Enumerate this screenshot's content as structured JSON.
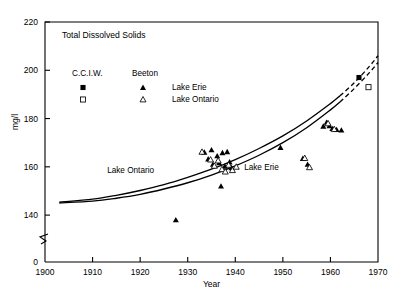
{
  "chart_data": {
    "type": "scatter",
    "title": "Total Dissolved Solids",
    "xlabel": "Year",
    "ylabel": "mg/l",
    "xlim": [
      1900,
      1970
    ],
    "ylim": [
      130,
      220
    ],
    "y_axis_broken": true,
    "y_break_base_label": "0",
    "grid": false,
    "legend_position": "upper-left-inside",
    "xticks": [
      1900,
      1910,
      1920,
      1930,
      1940,
      1950,
      1960,
      1970
    ],
    "xtick_labels": [
      "1900",
      "1910",
      "1920",
      "1930",
      "1940",
      "1950",
      "1960",
      "1970"
    ],
    "yticks": [
      140,
      160,
      180,
      200,
      220
    ],
    "ytick_labels": [
      "140",
      "160",
      "180",
      "200",
      "220"
    ],
    "legend": {
      "column_headers": [
        "C.C.I.W.",
        "Beeton"
      ],
      "rows": [
        {
          "label": "Lake Erie",
          "cciw_marker": "filled-square",
          "beeton_marker": "filled-triangle"
        },
        {
          "label": "Lake Ontario",
          "cciw_marker": "open-square",
          "beeton_marker": "open-triangle"
        }
      ]
    },
    "annotations": [
      {
        "text": "Lake Ontario",
        "x": 1918.0,
        "y": 157.5
      },
      {
        "text": "Lake Erie",
        "x": 1945.5,
        "y": 158.5
      }
    ],
    "series": [
      {
        "name": "Lake Erie trend",
        "type": "line",
        "style": "solid-then-dashed",
        "dash_start_x": 1962,
        "points": [
          [
            1903,
            145.0
          ],
          [
            1910,
            145.8
          ],
          [
            1915,
            147.0
          ],
          [
            1920,
            148.6
          ],
          [
            1925,
            150.8
          ],
          [
            1930,
            153.4
          ],
          [
            1935,
            156.6
          ],
          [
            1940,
            160.4
          ],
          [
            1945,
            164.8
          ],
          [
            1950,
            170.0
          ],
          [
            1955,
            176.2
          ],
          [
            1960,
            183.6
          ],
          [
            1962,
            186.9
          ],
          [
            1965,
            192.4
          ],
          [
            1968,
            198.6
          ],
          [
            1970,
            203.2
          ]
        ]
      },
      {
        "name": "Lake Ontario trend",
        "type": "line",
        "style": "solid-then-dashed",
        "dash_start_x": 1962,
        "points": [
          [
            1903,
            145.4
          ],
          [
            1910,
            146.6
          ],
          [
            1915,
            148.2
          ],
          [
            1920,
            150.2
          ],
          [
            1925,
            152.6
          ],
          [
            1930,
            155.6
          ],
          [
            1935,
            159.0
          ],
          [
            1940,
            163.0
          ],
          [
            1945,
            167.6
          ],
          [
            1950,
            172.8
          ],
          [
            1955,
            179.0
          ],
          [
            1960,
            186.2
          ],
          [
            1962,
            189.4
          ],
          [
            1965,
            194.8
          ],
          [
            1968,
            201.2
          ],
          [
            1970,
            206.0
          ]
        ]
      },
      {
        "name": "Lake Erie (Beeton)",
        "type": "scatter",
        "marker": "filled-triangle",
        "points": [
          [
            1927.5,
            138.0
          ],
          [
            1933.5,
            166.0
          ],
          [
            1934.3,
            163.2
          ],
          [
            1935.0,
            167.0
          ],
          [
            1935.3,
            161.0
          ],
          [
            1936.2,
            164.5
          ],
          [
            1936.6,
            161.6
          ],
          [
            1937.0,
            152.0
          ],
          [
            1937.3,
            165.8
          ],
          [
            1937.8,
            160.2
          ],
          [
            1938.3,
            166.2
          ],
          [
            1938.8,
            162.0
          ],
          [
            1939.2,
            159.6
          ],
          [
            1949.5,
            168.0
          ],
          [
            1954.2,
            163.4
          ],
          [
            1955.2,
            161.0
          ],
          [
            1958.5,
            176.8
          ],
          [
            1959.2,
            178.4
          ],
          [
            1959.8,
            177.0
          ],
          [
            1960.4,
            175.8
          ],
          [
            1961.3,
            175.4
          ],
          [
            1962.3,
            175.2
          ]
        ]
      },
      {
        "name": "Lake Ontario (Beeton)",
        "type": "scatter",
        "marker": "open-triangle",
        "points": [
          [
            1933.0,
            166.2
          ],
          [
            1934.8,
            163.0
          ],
          [
            1935.6,
            160.4
          ],
          [
            1936.4,
            162.6
          ],
          [
            1937.2,
            159.0
          ],
          [
            1937.9,
            158.0
          ],
          [
            1938.6,
            160.8
          ],
          [
            1939.4,
            158.6
          ],
          [
            1940.2,
            160.0
          ],
          [
            1954.6,
            163.6
          ],
          [
            1955.6,
            159.8
          ],
          [
            1959.5,
            178.0
          ],
          [
            1960.8,
            175.6
          ]
        ]
      },
      {
        "name": "Lake Erie (C.C.I.W.)",
        "type": "scatter",
        "marker": "filled-square",
        "points": [
          [
            1966.0,
            197.0
          ]
        ]
      },
      {
        "name": "Lake Ontario (C.C.I.W.)",
        "type": "scatter",
        "marker": "open-square",
        "points": [
          [
            1968.0,
            193.0
          ]
        ]
      }
    ]
  }
}
